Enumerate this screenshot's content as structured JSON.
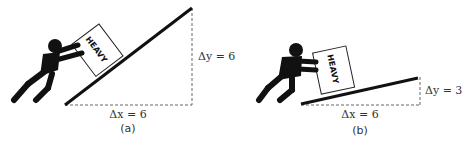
{
  "panels": [
    {
      "id": "a",
      "caption": "(a)",
      "box_label": "HEAVY",
      "delta_x_label": "Δx = 6",
      "delta_y_label": "Δy = 6",
      "delta_x": 6,
      "delta_y": 6,
      "slope_description": "steep ramp"
    },
    {
      "id": "b",
      "caption": "(b)",
      "box_label": "HEAVY",
      "delta_x_label": "Δx = 6",
      "delta_y_label": "Δy = 3",
      "delta_x": 6,
      "delta_y": 3,
      "slope_description": "gentle ramp"
    }
  ],
  "colors": {
    "ink": "#111111",
    "dash": "#666666",
    "text": "#333333",
    "background": "#ffffff"
  }
}
